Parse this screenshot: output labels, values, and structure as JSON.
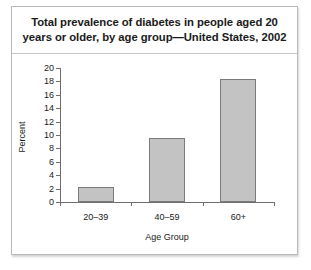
{
  "chart_data": {
    "type": "bar",
    "title": "Total prevalence of diabetes in people aged 20 years or older, by age group—United States, 2002",
    "title_line1": "Total prevalence of diabetes in people aged 20",
    "title_line2": "years or older, by age group—United States, 2002",
    "categories": [
      "20–39",
      "40–59",
      "60+"
    ],
    "values": [
      2.3,
      9.6,
      18.3
    ],
    "xlabel": "Age Group",
    "ylabel": "Percent",
    "ylim": [
      0,
      20
    ],
    "ytick_values": [
      0,
      2,
      4,
      6,
      8,
      10,
      12,
      14,
      16,
      18,
      20
    ],
    "ytick_labels": [
      "0",
      "2",
      "4",
      "6",
      "8",
      "10",
      "12",
      "14",
      "16",
      "18",
      "20"
    ],
    "grid": false,
    "legend": false,
    "bar_color": "#c3c3c3",
    "bar_edge_color": "#7b7b7b",
    "axis_color": "#6e6e6e"
  }
}
